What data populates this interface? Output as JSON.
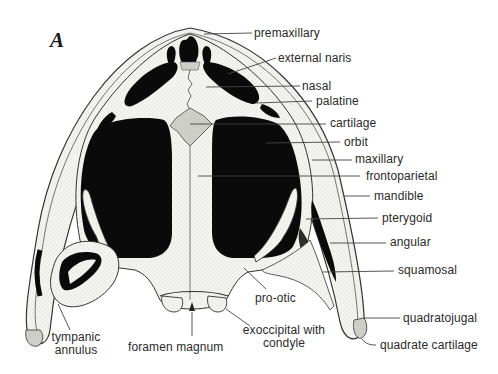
{
  "figure": {
    "panel_letter": "A",
    "colors": {
      "background": "#ffffff",
      "bone": "#f2f2ee",
      "cartilage": "#d8d8d2",
      "opening": "#0a0a0a",
      "outline": "#333333",
      "leader_line": "#444444",
      "label_text": "#2a2a2a"
    }
  },
  "labels": {
    "premaxillary": "premaxillary",
    "external_naris": "external naris",
    "nasal": "nasal",
    "palatine": "palatine",
    "cartilage": "cartilage",
    "orbit": "orbit",
    "maxillary": "maxillary",
    "frontoparietal": "frontoparietal",
    "mandible": "mandible",
    "pterygoid": "pterygoid",
    "angular": "angular",
    "squamosal": "squamosal",
    "pro_otic": "pro-otic",
    "quadratojugal": "quadratojugal",
    "quadrate_cartilage": "quadrate cartilage",
    "exoccipital_line1": "exoccipital with",
    "exoccipital_line2": "condyle",
    "foramen_magnum": "foramen magnum",
    "tympanic_line1": "tympanic",
    "tympanic_line2": "annulus"
  }
}
